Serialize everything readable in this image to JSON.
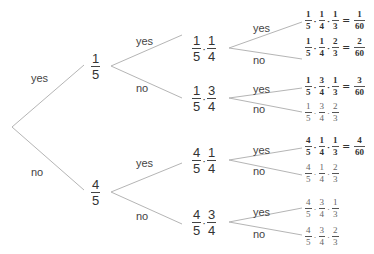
{
  "diagram": {
    "type": "probability-tree",
    "branch_labels": {
      "yes": "yes",
      "no": "no"
    },
    "level1": [
      {
        "label": "yes",
        "num": "1",
        "den": "5"
      },
      {
        "label": "no",
        "num": "4",
        "den": "5"
      }
    ],
    "level2": [
      {
        "label": "yes",
        "factors": [
          {
            "num": "1",
            "den": "5"
          },
          {
            "num": "1",
            "den": "4"
          }
        ]
      },
      {
        "label": "no",
        "factors": [
          {
            "num": "1",
            "den": "5"
          },
          {
            "num": "3",
            "den": "4"
          }
        ]
      },
      {
        "label": "yes",
        "factors": [
          {
            "num": "4",
            "den": "5"
          },
          {
            "num": "1",
            "den": "4"
          }
        ]
      },
      {
        "label": "no",
        "factors": [
          {
            "num": "4",
            "den": "5"
          },
          {
            "num": "3",
            "den": "4"
          }
        ]
      }
    ],
    "level3": [
      {
        "label": "yes",
        "factors": [
          {
            "num": "1",
            "den": "5"
          },
          {
            "num": "1",
            "den": "4"
          },
          {
            "num": "1",
            "den": "3"
          }
        ],
        "result": {
          "num": "1",
          "den": "60"
        }
      },
      {
        "label": "no",
        "factors": [
          {
            "num": "1",
            "den": "5"
          },
          {
            "num": "1",
            "den": "4"
          },
          {
            "num": "2",
            "den": "3"
          }
        ],
        "result": {
          "num": "2",
          "den": "60"
        }
      },
      {
        "label": "yes",
        "factors": [
          {
            "num": "1",
            "den": "5"
          },
          {
            "num": "3",
            "den": "4"
          },
          {
            "num": "1",
            "den": "3"
          }
        ],
        "result": {
          "num": "3",
          "den": "60"
        }
      },
      {
        "label": "no",
        "factors": [
          {
            "num": "1",
            "den": "5"
          },
          {
            "num": "3",
            "den": "4"
          },
          {
            "num": "2",
            "den": "3"
          }
        ],
        "result": null
      },
      {
        "label": "yes",
        "factors": [
          {
            "num": "4",
            "den": "5"
          },
          {
            "num": "1",
            "den": "4"
          },
          {
            "num": "1",
            "den": "3"
          }
        ],
        "result": {
          "num": "4",
          "den": "60"
        }
      },
      {
        "label": "no",
        "factors": [
          {
            "num": "4",
            "den": "5"
          },
          {
            "num": "1",
            "den": "4"
          },
          {
            "num": "2",
            "den": "3"
          }
        ],
        "result": null
      },
      {
        "label": "yes",
        "factors": [
          {
            "num": "4",
            "den": "5"
          },
          {
            "num": "3",
            "den": "4"
          },
          {
            "num": "1",
            "den": "3"
          }
        ],
        "result": null
      },
      {
        "label": "no",
        "factors": [
          {
            "num": "4",
            "den": "5"
          },
          {
            "num": "3",
            "den": "4"
          },
          {
            "num": "2",
            "den": "3"
          }
        ],
        "result": null
      }
    ],
    "symbols": {
      "dot": "·",
      "equals": "="
    },
    "line_color": "#b0b0b0"
  }
}
